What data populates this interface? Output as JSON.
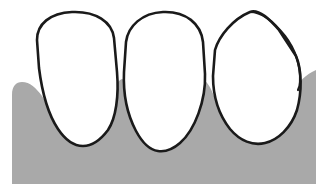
{
  "figure": {
    "title": "Anterior teeth with gingiva",
    "width": 323,
    "height": 192,
    "background_color": "#ffffff"
  },
  "colors": {
    "background": "#ffffff",
    "gingiva_fill": "#a9a9a9",
    "tooth_fill": "#ffffff",
    "outline": "#1a1a1a",
    "contour_overlay": "#1a1a1a"
  },
  "strokes": {
    "tooth_outline_width": 2.6,
    "gingiva_outline_width": 0,
    "contour_overlay_width": 2.2
  },
  "gingiva": {
    "label": "gingiva",
    "description": "gray scalloped gum tissue",
    "fill": "#a9a9a9",
    "left_edge_x": 12,
    "right_edge_x": 316,
    "bottom_y": 184,
    "path": "M 12 184 L 12 95 C 12 86 16 82 22 82 C 30 82 36 88 42 96 L 62 128 L 84 143 L 104 126 L 112 100 C 114 88 118 80 122 79 C 126 80 130 88 133 100 L 143 130 L 158 147 L 175 133 L 190 99 C 194 88 198 80 202 79 C 206 80 210 86 214 96 L 228 126 L 248 142 L 268 128 L 288 98 C 296 85 304 76 312 72 L 316 70 L 316 184 Z"
  },
  "teeth": [
    {
      "id": "tooth-1",
      "label": "incisor-left",
      "position": 1,
      "crown_apex_y": 14,
      "root_tip_y": 143,
      "fill": "#ffffff",
      "path": "M 37 40 C 37 24 50 13 72 12 C 96 11 112 22 114 38 L 117 72 C 119 96 116 118 108 130 C 99 142 90 146 83 146 C 75 146 66 141 58 129 C 48 114 42 92 39 68 Z"
    },
    {
      "id": "tooth-2",
      "label": "incisor-middle",
      "position": 2,
      "crown_apex_y": 13,
      "root_tip_y": 149,
      "fill": "#ffffff",
      "path": "M 126 42 C 128 26 142 13 163 12 C 186 11 201 24 203 42 L 205 74 C 206 100 195 130 180 143 C 172 150 165 152 158 151 C 150 150 143 144 136 131 C 127 114 123 94 124 72 Z"
    },
    {
      "id": "tooth-3",
      "label": "incisor-right",
      "position": 3,
      "crown_apex_y": 11,
      "root_tip_y": 142,
      "fill": "#ffffff",
      "path": "M 215 50 C 219 36 233 19 250 12 C 258 9 268 17 279 30 L 296 56 C 302 70 302 92 297 110 C 291 128 278 140 265 143 C 253 146 240 141 230 129 C 219 115 213 96 213 76 Z"
    }
  ],
  "contour_overlay": {
    "id": "tooth-3-contour",
    "label": "overlay contour line on right incisor",
    "description": "second outline tracing an alternate mesial-incisal contour, diverging from the crown apex and rejoining near the distal surface",
    "attached_to": "tooth-3",
    "apex_point": [
      250,
      11
    ],
    "rejoin_point": [
      298,
      88
    ],
    "path": "M 250 12 C 262 12 274 22 285 36 C 295 49 301 66 300 82 C 300 86 299 88 298 90"
  },
  "annotations": {
    "caption": "",
    "labels": []
  }
}
